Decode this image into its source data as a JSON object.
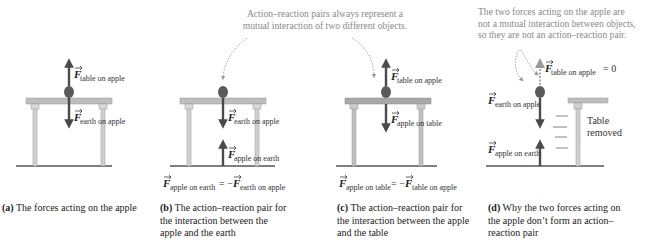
{
  "annotations": {
    "note_bc_line1": "Action–reaction pairs always represent a",
    "note_bc_line2": "mutual interaction of two different objects.",
    "note_d_line1": "The two forces acting on the apple are",
    "note_d_line2": "not a mutual interaction between objects,",
    "note_d_line3": "so they are not an action–reaction pair."
  },
  "panels": [
    {
      "id": "a",
      "caption_label": "(a)",
      "caption_text": "The forces acting on the apple",
      "forces": [
        {
          "symbol": "F",
          "subscript": "table on apple",
          "direction": "up"
        },
        {
          "symbol": "F",
          "subscript": "earth on apple",
          "direction": "down"
        }
      ]
    },
    {
      "id": "b",
      "caption_label": "(b)",
      "caption_text_line1": "The action–reaction pair for",
      "caption_text_line2": "the interaction between the",
      "caption_text_line3": "apple and the earth",
      "forces": [
        {
          "symbol": "F",
          "subscript": "earth on apple",
          "direction": "down"
        },
        {
          "symbol": "F",
          "subscript": "apple on earth",
          "direction": "up"
        }
      ],
      "equation": {
        "lhs_sub": "apple on earth",
        "op": "= −",
        "rhs_sub": "earth on apple"
      }
    },
    {
      "id": "c",
      "caption_label": "(c)",
      "caption_text_line1": "The action–reaction pair for",
      "caption_text_line2": "the interaction between the apple",
      "caption_text_line3": "and the table",
      "forces": [
        {
          "symbol": "F",
          "subscript": "table on apple",
          "direction": "up"
        },
        {
          "symbol": "F",
          "subscript": "apple on table",
          "direction": "down"
        }
      ],
      "equation": {
        "lhs_sub": "apple on table",
        "op": "= −",
        "rhs_sub": "table on apple"
      }
    },
    {
      "id": "d",
      "caption_label": "(d)",
      "caption_text_line1": "Why the two forces acting on",
      "caption_text_line2": "the apple don’t form an action–",
      "caption_text_line3": "reaction pair",
      "forces": [
        {
          "symbol": "F",
          "subscript": "table on apple",
          "direction": "up",
          "value_suffix": "= 0"
        },
        {
          "symbol": "F",
          "subscript": "earth on apple",
          "direction": "down"
        },
        {
          "symbol": "F",
          "subscript": "apple on earth",
          "direction": "up"
        }
      ],
      "table_label_line1": "Table",
      "table_label_line2": "removed"
    }
  ],
  "colors": {
    "arrow": "#4a4a4a",
    "apple": "#5a5a5a",
    "table_top": "#bdbdbd",
    "table_leg": "#d0d0d0",
    "ground": "#555555",
    "annotation_text": "#8a8a8a"
  }
}
